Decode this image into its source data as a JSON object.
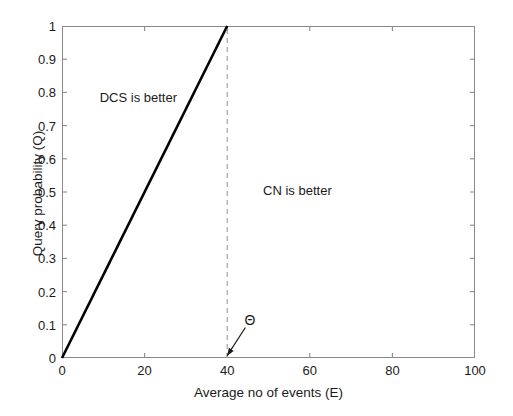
{
  "chart_data": {
    "type": "line",
    "title": "",
    "xlabel": "Average no of events (E)",
    "ylabel": "Query probability (Q)",
    "xlim": [
      0,
      100
    ],
    "ylim": [
      0,
      1
    ],
    "grid": false,
    "legend": null,
    "xticks": [
      "0",
      "20",
      "40",
      "60",
      "80",
      "100"
    ],
    "xtick_values": [
      0,
      20,
      40,
      60,
      80,
      100
    ],
    "yticks": [
      "0",
      "0.1",
      "0.2",
      "0.3",
      "0.4",
      "0.5",
      "0.6",
      "0.7",
      "0.8",
      "0.9",
      "1"
    ],
    "ytick_values": [
      0,
      0.1,
      0.2,
      0.3,
      0.4,
      0.5,
      0.6,
      0.7,
      0.8,
      0.9,
      1
    ],
    "series": [
      {
        "name": "threshold-boundary",
        "style": "solid",
        "color": "#000000",
        "width": 2.6,
        "x": [
          0,
          40
        ],
        "y": [
          0,
          1
        ]
      },
      {
        "name": "theta-marker",
        "style": "dashed",
        "color": "#9a9a9a",
        "width": 1.1,
        "x": [
          40,
          40
        ],
        "y": [
          0,
          1
        ]
      }
    ],
    "annotations": [
      {
        "name": "dcs-region-label",
        "text": "DCS is better",
        "x": 18.5,
        "y": 0.785
      },
      {
        "name": "cn-region-label",
        "text": "CN is better",
        "x": 57.0,
        "y": 0.505
      },
      {
        "name": "theta-symbol",
        "text": "Θ",
        "x": 45.5,
        "y": 0.115
      }
    ],
    "arrow": {
      "name": "theta-arrow",
      "from_x": 44.4,
      "from_y": 0.092,
      "to_x": 40.0,
      "to_y": 0.007,
      "color": "#1a1a1a"
    }
  },
  "colors": {
    "background": "#ffffff",
    "axis": "#8a8a8a",
    "text": "#1a1a1a",
    "data_line": "#000000",
    "dashed_line": "#9a9a9a"
  }
}
